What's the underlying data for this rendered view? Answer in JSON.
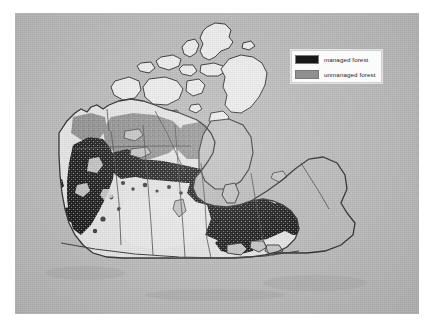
{
  "figure": {
    "panel_background": "#b9b9b9",
    "outer_background": "#ffffff"
  },
  "legend": {
    "name": "map-legend",
    "background": "#fbfbfb",
    "border_color": "#cfcfcf",
    "items": [
      {
        "label": "managed forest",
        "color": "#171717",
        "swatch_name": "legend-swatch-managed"
      },
      {
        "label": "unmanaged forest",
        "color": "#8f8f8f",
        "swatch_name": "legend-swatch-unmanaged"
      }
    ]
  },
  "map": {
    "name": "canada-forest-map",
    "region": "Canada",
    "colors": {
      "managed_forest": "#171717",
      "unmanaged_forest": "#8f8f8f",
      "non_forest_land": "#e4e4e4",
      "water_background": "#b9b9b9",
      "coastline": "#2a2a2a",
      "province_border": "#4a4a4a",
      "arctic_islands": "#ececec"
    },
    "classes": [
      {
        "key": "managed_forest",
        "label": "managed forest"
      },
      {
        "key": "unmanaged_forest",
        "label": "unmanaged forest"
      }
    ],
    "description": "Managed forest concentrated in a broad southern band across British Columbia, the boreal fringe of the Prairies, northern Ontario, Quebec, the Maritimes and Newfoundland; unmanaged forest covers the northern boreal interior, Northwest Territories, northern Quebec and Labrador; Arctic archipelago and prairie interior are non-forest."
  }
}
